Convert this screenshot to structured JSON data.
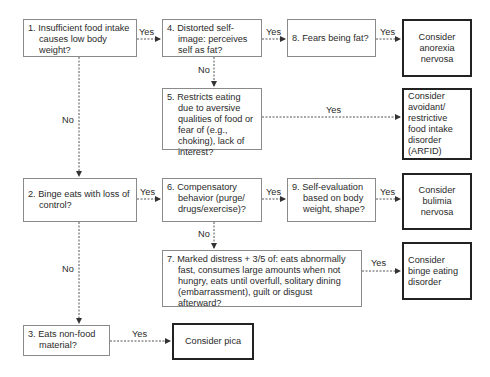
{
  "diagram": {
    "type": "flowchart",
    "nodes": {
      "q1": {
        "text": "1. Insufficient food intake causes low body weight?"
      },
      "q4": {
        "text": "4. Distorted self-image: perceives self as fat?"
      },
      "q8": {
        "text": "8. Fears being fat?"
      },
      "anorexia": {
        "text": "Consider anorexia nervosa"
      },
      "q5": {
        "text": "5. Restricts eating due to aversive qualities of food or fear of (e.g., choking), lack of interest?"
      },
      "arfid": {
        "text": "Consider avoidant/ restrictive food intake disorder (ARFID)"
      },
      "q2": {
        "text": "2. Binge eats with loss of control?"
      },
      "q6": {
        "text": "6. Compensatory behavior (purge/ drugs/exercise)?"
      },
      "q9": {
        "text": "9. Self-evaluation based on body weight, shape?"
      },
      "bulimia": {
        "text": "Consider bulimia nervosa"
      },
      "q7": {
        "text": "7. Marked distress + 3/5 of: eats abnormally fast, consumes large amounts when not hungry, eats until overfull, solitary dining (embarrassment), guilt or disgust afterward?"
      },
      "binge": {
        "text": "Consider binge eating disorder"
      },
      "q3": {
        "text": "3. Eats non-food material?"
      },
      "pica": {
        "text": "Consider pica"
      }
    },
    "edges": [
      {
        "from": "q1",
        "to": "q4",
        "label": "Yes"
      },
      {
        "from": "q4",
        "to": "q8",
        "label": "Yes"
      },
      {
        "from": "q8",
        "to": "anorexia",
        "label": "Yes"
      },
      {
        "from": "q4",
        "to": "q5",
        "label": "No"
      },
      {
        "from": "q5",
        "to": "arfid",
        "label": "Yes"
      },
      {
        "from": "q1",
        "to": "q2",
        "label": "No"
      },
      {
        "from": "q2",
        "to": "q6",
        "label": "Yes"
      },
      {
        "from": "q6",
        "to": "q9",
        "label": "Yes"
      },
      {
        "from": "q9",
        "to": "bulimia",
        "label": "Yes"
      },
      {
        "from": "q6",
        "to": "q7",
        "label": "No"
      },
      {
        "from": "q7",
        "to": "binge",
        "label": "Yes"
      },
      {
        "from": "q2",
        "to": "q3",
        "label": "No"
      },
      {
        "from": "q3",
        "to": "pica",
        "label": "Yes"
      }
    ]
  }
}
